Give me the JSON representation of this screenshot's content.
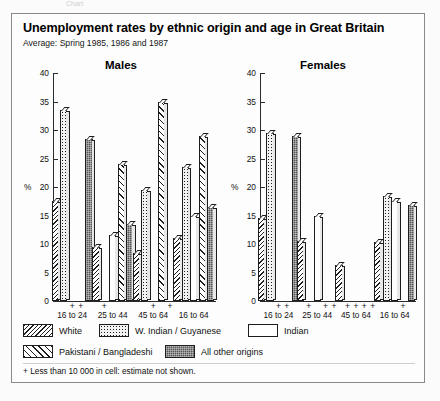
{
  "ghost_text": "Chart",
  "header": {
    "title": "Unemployment rates by ethnic origin and age in Great Britain",
    "subtitle": "Average: Spring 1985, 1986 and 1987"
  },
  "footnote": "+ Less than 10 000 in cell: estimate not shown.",
  "legend": [
    {
      "key": "white",
      "label": "White",
      "swatch": "dense-diagonal-hatch"
    },
    {
      "key": "wind",
      "label": "W. Indian / Guyanese",
      "swatch": "dotted"
    },
    {
      "key": "indian",
      "label": "Indian",
      "swatch": "blank"
    },
    {
      "key": "pak",
      "label": "Pakistani / Bangladeshi",
      "swatch": "sparse-diagonal-hatch"
    },
    {
      "key": "other",
      "label": "All other origins",
      "swatch": "dark-checker"
    }
  ],
  "chart_data": {
    "type": "bar",
    "title": "Unemployment rates by ethnic origin and age in Great Britain",
    "subtitle": "Average: Spring 1985, 1986 and 1987",
    "ylabel": "%",
    "xlabel": "",
    "ylim": [
      0,
      40
    ],
    "yticks": [
      0,
      5,
      10,
      15,
      20,
      25,
      30,
      35,
      40
    ],
    "grid": false,
    "legend_position": "below",
    "missing_marker": "+",
    "missing_note": "+ Less than 10 000 in cell: estimate not shown.",
    "categories": [
      "16 to 24",
      "25 to 44",
      "45 to 64",
      "16 to 64"
    ],
    "series_order": [
      "White",
      "W. Indian / Guyanese",
      "Indian",
      "Pakistani / Bangladeshi",
      "All other origins"
    ],
    "panels": [
      {
        "name": "Males",
        "series": [
          {
            "name": "White",
            "values": [
              17.5,
              9.5,
              8.5,
              11.0
            ]
          },
          {
            "name": "W. Indian / Guyanese",
            "values": [
              33.5,
              null,
              19.5,
              23.5
            ]
          },
          {
            "name": "Indian",
            "values": [
              null,
              11.5,
              null,
              15.0
            ]
          },
          {
            "name": "Pakistani / Bangladeshi",
            "values": [
              null,
              24.0,
              35.0,
              29.0
            ]
          },
          {
            "name": "All other origins",
            "values": [
              28.5,
              13.5,
              null,
              16.5
            ]
          }
        ]
      },
      {
        "name": "Females",
        "series": [
          {
            "name": "White",
            "values": [
              14.5,
              10.5,
              6.3,
              10.3
            ]
          },
          {
            "name": "W. Indian / Guyanese",
            "values": [
              29.5,
              null,
              null,
              18.5
            ]
          },
          {
            "name": "Indian",
            "values": [
              null,
              15.0,
              null,
              17.5
            ]
          },
          {
            "name": "Pakistani / Bangladeshi",
            "values": [
              null,
              null,
              null,
              null
            ]
          },
          {
            "name": "All other origins",
            "values": [
              29.0,
              null,
              null,
              16.8
            ]
          }
        ]
      }
    ]
  }
}
